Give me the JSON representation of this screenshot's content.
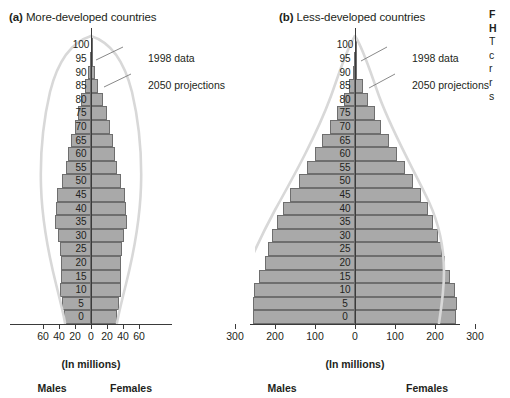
{
  "figure": {
    "panels": [
      {
        "id": "a",
        "marker": "(a)",
        "title": "More-developed countries",
        "axis_label": "(In millions)",
        "male_label": "Males",
        "female_label": "Females",
        "annotations": [
          {
            "text": "1998 data"
          },
          {
            "text": "2050 projections"
          }
        ]
      },
      {
        "id": "b",
        "marker": "(b)",
        "title": "Less-developed countries",
        "axis_label": "(In millions)",
        "male_label": "Males",
        "female_label": "Females",
        "annotations": [
          {
            "text": "1998 data"
          },
          {
            "text": "2050 projections"
          }
        ]
      }
    ],
    "caption_clipped": [
      "F",
      "H",
      "T",
      "c",
      "r",
      "r",
      "s"
    ]
  },
  "colors": {
    "bar_fill": "#a9a9a9",
    "bar_stroke": "#6e6e6e",
    "axis": "#3a3a3a",
    "projection_curve": "#d6d6d6",
    "text": "#231f20",
    "background": "#ffffff"
  },
  "chart_data": [
    {
      "type": "bar",
      "subtype": "population-pyramid",
      "panel": "a",
      "title": "(a) More-developed countries",
      "xlabel": "(In millions)",
      "ylabel": "Age",
      "xlim": [
        -60,
        60
      ],
      "xticks": [
        60,
        40,
        20,
        0,
        20,
        40,
        60
      ],
      "xtick_labels": [
        "60",
        "40",
        "20",
        "0",
        "20",
        "40",
        "60"
      ],
      "categories": [
        "100",
        "95",
        "90",
        "85",
        "80",
        "75",
        "70",
        "65",
        "60",
        "55",
        "50",
        "45",
        "40",
        "35",
        "30",
        "25",
        "20",
        "15",
        "10",
        "5",
        "0"
      ],
      "grid": false,
      "legend": "none",
      "series": [
        {
          "name": "Males",
          "side": "left",
          "values": [
            0.4,
            1.5,
            3.5,
            7.5,
            12.0,
            16.5,
            20.5,
            25.0,
            28.5,
            31.5,
            36.0,
            42.5,
            43.5,
            45.0,
            41.0,
            38.5,
            37.0,
            38.0,
            38.5,
            36.0,
            33.5
          ]
        },
        {
          "name": "Females",
          "side": "right",
          "values": [
            0.6,
            2.0,
            4.5,
            9.0,
            14.5,
            19.5,
            23.5,
            27.0,
            30.0,
            32.5,
            37.0,
            43.0,
            44.0,
            45.5,
            41.5,
            39.0,
            37.0,
            37.5,
            37.5,
            35.0,
            32.0
          ]
        }
      ],
      "overlay_curve": {
        "name": "2050 projections",
        "description": "Smooth outline bulging outward at older ages and narrowing at younger ages relative to the 1998 bars"
      },
      "annotations": [
        "1998 data",
        "2050 projections"
      ]
    },
    {
      "type": "bar",
      "subtype": "population-pyramid",
      "panel": "b",
      "title": "(b) Less-developed countries",
      "xlabel": "(In millions)",
      "ylabel": "Age",
      "xlim": [
        -300,
        300
      ],
      "xticks": [
        300,
        200,
        100,
        0,
        100,
        200,
        300
      ],
      "xtick_labels": [
        "300",
        "200",
        "100",
        "0",
        "100",
        "200",
        "300"
      ],
      "categories": [
        "100",
        "95",
        "90",
        "85",
        "80",
        "75",
        "70",
        "65",
        "60",
        "55",
        "50",
        "45",
        "40",
        "35",
        "30",
        "25",
        "20",
        "15",
        "10",
        "5",
        "0"
      ],
      "grid": false,
      "legend": "none",
      "series": [
        {
          "name": "Males",
          "side": "left",
          "values": [
            0.5,
            2.0,
            5.0,
            16.0,
            28.0,
            45.0,
            62.0,
            82.0,
            100.0,
            120.0,
            140.0,
            162.0,
            180.0,
            196.0,
            208.0,
            218.0,
            226.0,
            240.0,
            252.0,
            256.0,
            255.0
          ]
        },
        {
          "name": "Females",
          "side": "right",
          "values": [
            0.7,
            2.5,
            6.0,
            19.0,
            32.0,
            50.0,
            66.0,
            86.0,
            104.0,
            124.0,
            144.0,
            164.0,
            182.0,
            196.0,
            207.0,
            217.0,
            224.0,
            238.0,
            250.0,
            254.0,
            253.0
          ]
        }
      ],
      "overlay_curve": {
        "name": "2050 projections",
        "description": "Large outward bulge reaching near the +/-300 million limits across young and middle ages"
      },
      "annotations": [
        "1998 data",
        "2050 projections"
      ]
    }
  ]
}
